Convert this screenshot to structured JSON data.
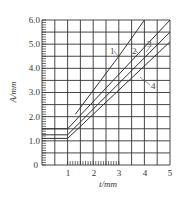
{
  "chart_data": {
    "type": "line",
    "title": "",
    "xlabel": "t/mm",
    "ylabel": "A/mm",
    "xlim": [
      0,
      5
    ],
    "ylim": [
      0,
      6.0
    ],
    "grid": true,
    "x_grid_step": 0.5,
    "y_grid_step": 0.5,
    "x_ticks": [
      "1",
      "2",
      "3",
      "4",
      "5"
    ],
    "y_ticks": [
      "0",
      "1.0",
      "2.0",
      "3.0",
      "4.0",
      "5.0",
      "6.0"
    ],
    "legend": "inline curve labels 1-4",
    "series": [
      {
        "name": "1",
        "points": [
          [
            1.3,
            2.1
          ],
          [
            3.0,
            4.5
          ],
          [
            4.0,
            6.0
          ]
        ]
      },
      {
        "name": "2",
        "points": [
          [
            0,
            1.5
          ],
          [
            1.0,
            1.5
          ],
          [
            5.0,
            6.0
          ]
        ]
      },
      {
        "name": "3",
        "points": [
          [
            0,
            1.25
          ],
          [
            1.0,
            1.25
          ],
          [
            5.0,
            5.5
          ]
        ]
      },
      {
        "name": "4",
        "points": [
          [
            0,
            1.1
          ],
          [
            1.0,
            1.1
          ],
          [
            5.0,
            5.1
          ]
        ]
      }
    ]
  },
  "labels": {
    "x_axis_title": "t/mm",
    "y_axis_title": "A/mm",
    "x_ticks": [
      "1",
      "2",
      "3",
      "4",
      "5"
    ],
    "y_ticks": [
      "0",
      "1.0",
      "2.0",
      "3.0",
      "4.0",
      "5.0",
      "6.0"
    ],
    "curves": [
      "1",
      "2",
      "3",
      "4"
    ]
  }
}
